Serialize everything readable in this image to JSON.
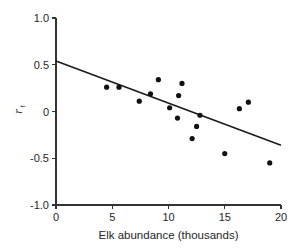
{
  "chart_data": {
    "type": "scatter",
    "title": "",
    "xlabel": "Elk abundance (thousands)",
    "ylabel": "r",
    "ylabel_subscript": "t",
    "xlim": [
      0,
      20
    ],
    "ylim": [
      -1.0,
      1.0
    ],
    "xticks": [
      0,
      5,
      10,
      15,
      20
    ],
    "xtick_labels": [
      "0",
      "5",
      "10",
      "15",
      "20"
    ],
    "yticks": [
      1.0,
      0.5,
      0,
      -0.5,
      -1.0
    ],
    "ytick_labels": [
      "1.0",
      "0.5",
      "0",
      "-0.5",
      "-1.0"
    ],
    "grid": false,
    "legend": false,
    "point_color": "#111111",
    "line_color": "#1a1a1a",
    "axis_color": "#333333",
    "points": [
      {
        "x": 4.5,
        "y": 0.26
      },
      {
        "x": 5.6,
        "y": 0.26
      },
      {
        "x": 7.4,
        "y": 0.11
      },
      {
        "x": 8.4,
        "y": 0.19
      },
      {
        "x": 9.1,
        "y": 0.34
      },
      {
        "x": 10.1,
        "y": 0.04
      },
      {
        "x": 10.8,
        "y": -0.07
      },
      {
        "x": 10.9,
        "y": 0.17
      },
      {
        "x": 11.2,
        "y": 0.3
      },
      {
        "x": 12.1,
        "y": -0.29
      },
      {
        "x": 12.5,
        "y": -0.16
      },
      {
        "x": 12.8,
        "y": -0.04
      },
      {
        "x": 15.0,
        "y": -0.45
      },
      {
        "x": 16.3,
        "y": 0.03
      },
      {
        "x": 17.1,
        "y": 0.1
      },
      {
        "x": 19.0,
        "y": -0.55
      }
    ],
    "fit_line": {
      "x_start": 0,
      "y_start": 0.54,
      "x_end": 20,
      "y_end": -0.36
    }
  }
}
